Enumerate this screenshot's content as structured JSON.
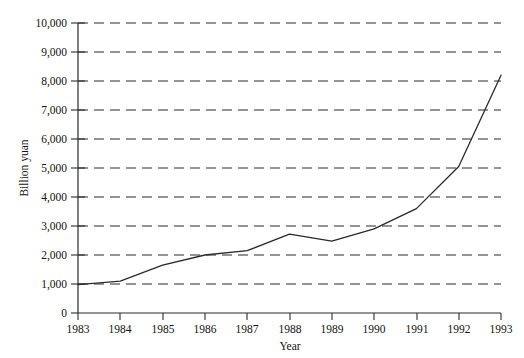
{
  "chart_data": {
    "type": "line",
    "title": "",
    "subtitle": "",
    "xlabel": "Year",
    "ylabel": "Billion yuan",
    "x": [
      1983,
      1984,
      1985,
      1986,
      1987,
      1988,
      1989,
      1990,
      1991,
      1992,
      1993
    ],
    "categories": [
      "1983",
      "1984",
      "1985",
      "1986",
      "1987",
      "1988",
      "1989",
      "1990",
      "1991",
      "1992",
      "1993"
    ],
    "values": [
      980,
      1100,
      1650,
      2000,
      2150,
      2720,
      2480,
      2900,
      3600,
      5050,
      8200
    ],
    "series": [
      {
        "name": "Billion yuan",
        "values": [
          980,
          1100,
          1650,
          2000,
          2150,
          2720,
          2480,
          2900,
          3600,
          5050,
          8200
        ]
      }
    ],
    "xlim": [
      1983,
      1993
    ],
    "ylim": [
      0,
      10000
    ],
    "ytick_values": [
      0,
      1000,
      2000,
      3000,
      4000,
      5000,
      6000,
      7000,
      8000,
      9000,
      10000
    ],
    "ytick_labels": [
      "0",
      "1,000",
      "2,000",
      "3,000",
      "4,000",
      "5,000",
      "6,000",
      "7,000",
      "8,000",
      "9,000",
      "10,000"
    ],
    "xtick_labels": [
      "1983",
      "1984",
      "1985",
      "1986",
      "1987",
      "1988",
      "1989",
      "1990",
      "1991",
      "1992",
      "1993"
    ],
    "grid": true,
    "grid_axis": "y",
    "grid_style": "dashed",
    "legend": false,
    "legend_position": "none",
    "line_color": "#2a2a2a",
    "grid_color": "#2b2b2b",
    "background_color": "#ffffff",
    "annotations": []
  },
  "axes": {
    "y_axis_title": "Billion yuan",
    "x_axis_title": "Year"
  }
}
